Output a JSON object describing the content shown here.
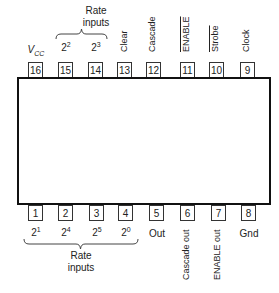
{
  "top": {
    "rate_label_line1": "Rate",
    "rate_label_line2": "inputs",
    "pins": [
      {
        "num": "16",
        "label": "V",
        "label_sub": "CC"
      },
      {
        "num": "15",
        "base": "2",
        "exp": "2"
      },
      {
        "num": "14",
        "base": "2",
        "exp": "3"
      },
      {
        "num": "13",
        "label": "Clear"
      },
      {
        "num": "12",
        "label": "Cascade"
      },
      {
        "num": "11",
        "label": "ENABLE",
        "overline": true
      },
      {
        "num": "10",
        "label": "Strobe",
        "overline": true
      },
      {
        "num": "9",
        "label": "Clock"
      }
    ]
  },
  "bottom": {
    "rate_label_line1": "Rate",
    "rate_label_line2": "inputs",
    "pins": [
      {
        "num": "1",
        "base": "2",
        "exp": "1"
      },
      {
        "num": "2",
        "base": "2",
        "exp": "4"
      },
      {
        "num": "3",
        "base": "2",
        "exp": "5"
      },
      {
        "num": "4",
        "base": "2",
        "exp": "0"
      },
      {
        "num": "5",
        "label": "Out"
      },
      {
        "num": "6",
        "label": "Cascade out"
      },
      {
        "num": "7",
        "label": "ENABLE out"
      },
      {
        "num": "8",
        "label": "Gnd"
      }
    ]
  }
}
